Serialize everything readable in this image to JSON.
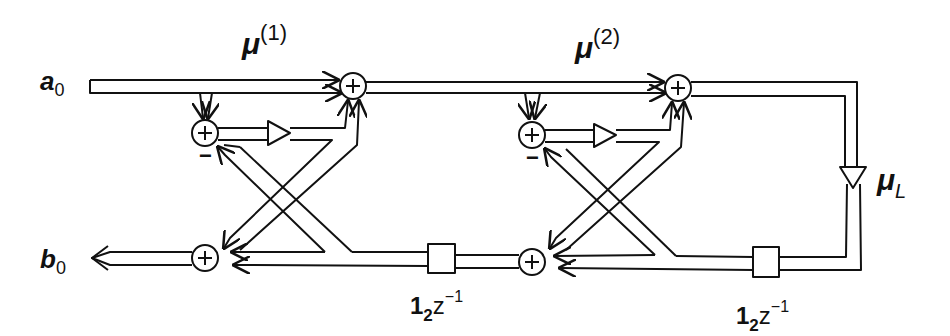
{
  "diagram": {
    "type": "signal-flow lattice filter",
    "inputs": [
      {
        "symbol": "a",
        "subscript": "0"
      }
    ],
    "outputs": [
      {
        "symbol": "b",
        "subscript": "0"
      }
    ],
    "stages": [
      {
        "label": "μ",
        "superscript": "(1)",
        "sign": "−",
        "delay": {
          "coef": "1",
          "sub": "2",
          "var": "z",
          "exp": "−1"
        }
      },
      {
        "label": "μ",
        "superscript": "(2)",
        "sign": "−",
        "delay": {
          "coef": "1",
          "sub": "2",
          "var": "z",
          "exp": "−1"
        }
      }
    ],
    "terminal_gain": {
      "symbol": "μ",
      "subscript": "L"
    },
    "adder_symbol": "+",
    "colors": {
      "line": "#111111",
      "background": "#ffffff"
    }
  }
}
